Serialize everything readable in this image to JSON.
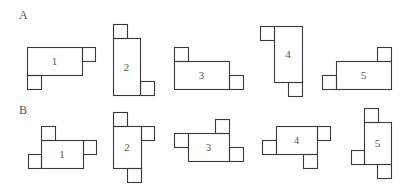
{
  "figure": {
    "stroke_color": "#3a3a3a",
    "text_color": "#555555",
    "rows": [
      {
        "label": "A",
        "label_pos": [
          19,
          9
        ],
        "pieces": [
          {
            "number": "1",
            "main": [
              27,
              47,
              55,
              28
            ],
            "squares": [
              [
                82,
                47,
                13,
                14
              ],
              [
                27,
                75,
                14,
                14
              ]
            ]
          },
          {
            "number": "2",
            "main": [
              113,
              38,
              27,
              57
            ],
            "squares": [
              [
                113,
                24,
                14,
                14
              ],
              [
                140,
                81,
                14,
                14
              ]
            ]
          },
          {
            "number": "3",
            "main": [
              174,
              61,
              55,
              28
            ],
            "squares": [
              [
                174,
                47,
                14,
                14
              ],
              [
                229,
                75,
                14,
                14
              ]
            ]
          },
          {
            "number": "4",
            "main": [
              274,
              26,
              28,
              56
            ],
            "squares": [
              [
                260,
                26,
                14,
                14
              ],
              [
                288,
                82,
                14,
                14
              ]
            ]
          },
          {
            "number": "5",
            "main": [
              336,
              61,
              55,
              28
            ],
            "squares": [
              [
                377,
                47,
                14,
                14
              ],
              [
                322,
                75,
                14,
                14
              ]
            ]
          }
        ]
      },
      {
        "label": "B",
        "label_pos": [
          19,
          104
        ],
        "pieces": [
          {
            "number": "1",
            "main": [
              41,
              140,
              42,
              28
            ],
            "squares": [
              [
                41,
                126,
                14,
                14
              ],
              [
                83,
                140,
                13,
                14
              ],
              [
                28,
                154,
                13,
                14
              ]
            ]
          },
          {
            "number": "2",
            "main": [
              113,
              126,
              28,
              42
            ],
            "squares": [
              [
                113,
                112,
                14,
                14
              ],
              [
                141,
                126,
                13,
                14
              ],
              [
                127,
                168,
                14,
                14
              ]
            ]
          },
          {
            "number": "3",
            "main": [
              188,
              133,
              41,
              28
            ],
            "squares": [
              [
                215,
                119,
                14,
                14
              ],
              [
                174,
                133,
                14,
                14
              ],
              [
                229,
                147,
                14,
                14
              ]
            ]
          },
          {
            "number": "4",
            "main": [
              276,
              126,
              41,
              28
            ],
            "squares": [
              [
                317,
                126,
                13,
                14
              ],
              [
                262,
                140,
                14,
                14
              ],
              [
                303,
                154,
                14,
                14
              ]
            ]
          },
          {
            "number": "5",
            "main": [
              364,
              122,
              27,
              42
            ],
            "squares": [
              [
                364,
                108,
                14,
                14
              ],
              [
                351,
                150,
                13,
                14
              ],
              [
                377,
                164,
                14,
                14
              ]
            ]
          }
        ]
      }
    ]
  }
}
